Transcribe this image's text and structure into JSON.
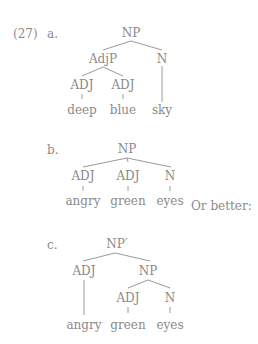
{
  "example_number": "(27)",
  "trees": [
    {
      "label": "a.",
      "root": "NP",
      "level1": [
        "AdjP",
        "N"
      ],
      "level2": [
        "ADJ",
        "ADJ"
      ],
      "words": [
        "deep",
        "blue",
        "sky"
      ]
    },
    {
      "label": "b.",
      "root": "NP",
      "level1": [
        "ADJ",
        "ADJ",
        "N"
      ],
      "words": [
        "angry",
        "green",
        "eyes"
      ]
    },
    {
      "label": "c.",
      "root": "NP′",
      "level1": [
        "ADJ",
        "NP"
      ],
      "level2": [
        "ADJ",
        "N"
      ],
      "words": [
        "angry",
        "green",
        "eyes"
      ]
    }
  ],
  "connector_text": "Or better:",
  "colors": {
    "text": "#8a8a8a",
    "lines": "#9a9a9a",
    "background": "#ffffff"
  }
}
